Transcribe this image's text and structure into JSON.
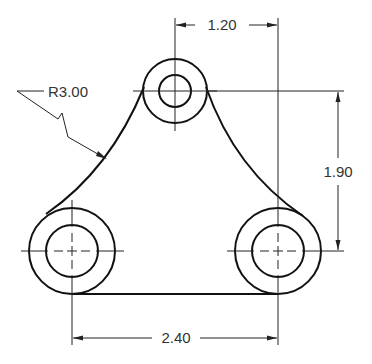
{
  "drawing": {
    "type": "mechanical-part-drawing",
    "stroke_color": "#111111",
    "background": "#ffffff"
  },
  "holes": [
    {
      "name": "top",
      "cx": 175,
      "cy": 91,
      "outer_r": 32,
      "inner_r": 16
    },
    {
      "name": "bottom-left",
      "cx": 72,
      "cy": 251,
      "outer_r": 43,
      "inner_r": 26
    },
    {
      "name": "bottom-right",
      "cx": 278,
      "cy": 251,
      "outer_r": 43,
      "inner_r": 26
    }
  ],
  "dimensions": {
    "horizontal_top": {
      "label": "1.20"
    },
    "vertical_right": {
      "label": "1.90"
    },
    "horizontal_bottom": {
      "label": "2.40"
    },
    "radius": {
      "label": "R3.00"
    }
  }
}
